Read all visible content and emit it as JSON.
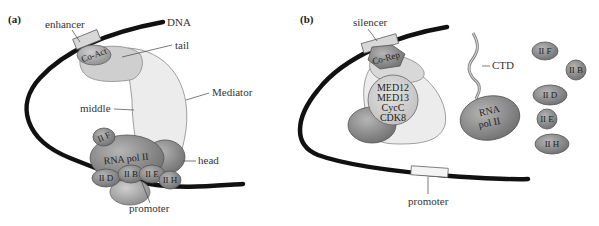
{
  "panels": [
    {
      "id": "a",
      "label": "(a)",
      "labels": {
        "enhancer": "enhancer",
        "dna": "DNA",
        "co_act": "Co-Act",
        "tail": "tail",
        "mediator": "Mediator",
        "middle": "middle",
        "head": "head",
        "rna_pol": "RNA pol II",
        "iif": "II F",
        "iid": "II D",
        "iib": "II B",
        "iie": "II E",
        "iih": "II H",
        "promoter": "promoter"
      }
    },
    {
      "id": "b",
      "label": "(b)",
      "labels": {
        "silencer": "silencer",
        "co_rep": "Co-Rep",
        "med12": "MED12",
        "med13": "MED13",
        "cycc": "CycC",
        "cdk8": "CDK8",
        "ctd": "CTD",
        "rna": "RNA",
        "pol": "pol II",
        "iif": "II F",
        "iib": "II B",
        "iid": "II D",
        "iie": "II E",
        "iih": "II H",
        "promoter": "promoter"
      }
    }
  ],
  "colors": {
    "dna": "#111111",
    "mediator_light": "#ececec",
    "tail": "#cfcfcf",
    "protein_dark": "#8a8a8a",
    "protein_mid": "#a8a8a8",
    "element_box": "#d8d8d8"
  }
}
